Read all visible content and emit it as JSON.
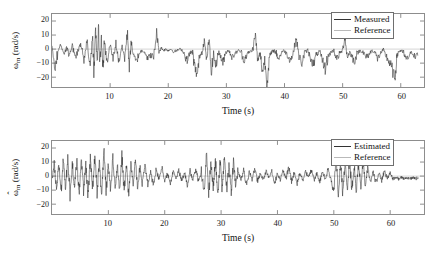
{
  "figure": {
    "background": "#ffffff",
    "panel_count": 2
  },
  "chart_data": [
    {
      "type": "line",
      "panel": "top",
      "title": "",
      "xlabel": "Time (s)",
      "ylabel": "ωm (rad/s)",
      "ylabel_symbol": "ω",
      "ylabel_subscript": "m",
      "ylabel_units": "(rad/s)",
      "xlim": [
        0,
        64
      ],
      "ylim": [
        -27,
        25
      ],
      "xticks": [
        10,
        20,
        30,
        40,
        50,
        60
      ],
      "yticks": [
        20,
        10,
        0,
        -10,
        -20
      ],
      "xtick_labels": [
        "10",
        "20",
        "30",
        "40",
        "50",
        "60"
      ],
      "ytick_labels": [
        "20",
        "10",
        "0",
        "−10",
        "−20"
      ],
      "grid": false,
      "legend_position": "top-right",
      "series": [
        {
          "name": "Measured",
          "color": "#2b2b2b",
          "description": "noisy motor speed with dense high-frequency oscillation 0-15 s and intermittent negative spikes to -25 rad/s afterwards",
          "x": [
            0.0,
            0.5,
            1.0,
            1.5,
            2.0,
            2.5,
            3.0,
            3.5,
            4.0,
            4.5,
            5.0,
            5.5,
            6.0,
            6.5,
            7.0,
            7.2,
            7.5,
            7.8,
            8.0,
            8.2,
            8.5,
            8.8,
            9.0,
            9.5,
            10.0,
            10.5,
            11.0,
            11.5,
            12.0,
            12.5,
            13.0,
            13.3,
            13.6,
            14.0,
            14.5,
            15.0,
            15.5,
            16.0,
            16.5,
            17.0,
            17.5,
            18.0,
            18.4,
            18.8,
            19.2,
            19.6,
            20.0,
            20.5,
            21.0,
            21.5,
            22.0,
            22.5,
            23.0,
            23.3,
            23.8,
            24.2,
            24.6,
            25.0,
            25.4,
            25.8,
            26.2,
            26.6,
            27.0,
            27.4,
            27.8,
            28.2,
            28.6,
            29.0,
            29.4,
            29.8,
            30.2,
            30.6,
            31.0,
            31.5,
            32.0,
            32.5,
            33.0,
            33.5,
            34.0,
            34.5,
            35.0,
            35.4,
            35.8,
            36.2,
            36.6,
            37.0,
            37.4,
            37.8,
            38.2,
            38.6,
            39.0,
            39.5,
            40.0,
            40.5,
            41.0,
            41.5,
            42.0,
            42.5,
            43.0,
            43.5,
            44.0,
            44.5,
            45.0,
            45.5,
            46.0,
            46.5,
            47.0,
            47.5,
            48.0,
            48.5,
            49.0,
            49.5,
            50.0,
            50.4,
            50.8,
            51.2,
            51.6,
            52.0,
            52.5,
            53.0,
            53.5,
            54.0,
            54.5,
            55.0,
            55.5,
            56.0,
            56.5,
            57.0,
            57.5,
            58.0,
            58.5,
            59.0,
            59.3,
            59.6,
            60.0,
            60.5,
            61.0,
            61.5,
            62.0,
            62.5,
            63.0,
            63.5
          ],
          "y": [
            -1,
            -13,
            -2,
            3,
            -4,
            1,
            -5,
            2,
            -6,
            -1,
            4,
            -8,
            6,
            -12,
            9,
            -16,
            14,
            -11,
            19,
            -13,
            7,
            -15,
            5,
            -10,
            3,
            -7,
            4,
            -9,
            2,
            -6,
            12,
            -14,
            6,
            -5,
            -9,
            -3,
            -1,
            -2,
            -7,
            -4,
            -6,
            12,
            -2,
            1,
            -1,
            0,
            -1,
            0,
            -2,
            -1,
            0,
            -1,
            -6,
            -8,
            -2,
            -3,
            -14,
            -18,
            -5,
            -2,
            6,
            -8,
            7,
            -16,
            -4,
            -12,
            -2,
            -5,
            -10,
            -3,
            -1,
            -2,
            -6,
            -3,
            -1,
            -2,
            -8,
            -4,
            -2,
            -1,
            10,
            -9,
            -3,
            -16,
            -8,
            -25,
            -6,
            -2,
            -1,
            -3,
            -7,
            -2,
            -1,
            -4,
            -8,
            -3,
            8,
            -5,
            -10,
            -2,
            -1,
            -6,
            -11,
            -4,
            -2,
            -8,
            -14,
            -5,
            -2,
            -1,
            -7,
            -3,
            -1,
            9,
            -6,
            -2,
            -5,
            -9,
            -3,
            -1,
            -2,
            -6,
            -4,
            -1,
            -2,
            -7,
            -3,
            -1,
            -5,
            -9,
            -14,
            -22,
            -6,
            -2,
            -1,
            -3,
            -8,
            -4,
            -2,
            -6,
            -3
          ]
        },
        {
          "name": "Reference",
          "color": "#c2c2c2",
          "description": "near-zero reference trace overlaid along the zero line",
          "x": [
            0,
            64
          ],
          "y": [
            0,
            0
          ]
        }
      ],
      "legend": [
        {
          "label": "Measured",
          "color": "#2b2b2b"
        },
        {
          "label": "Reference",
          "color": "#c2c2c2"
        }
      ]
    },
    {
      "type": "line",
      "panel": "bottom",
      "title": "",
      "xlabel": "Time (s)",
      "ylabel": "ω̂m (rad/s)",
      "ylabel_symbol": "ω",
      "ylabel_hat": "ˆ",
      "ylabel_subscript": "m",
      "ylabel_units": "(rad/s)",
      "xlim": [
        0,
        66
      ],
      "ylim": [
        -27,
        25
      ],
      "xticks": [
        10,
        20,
        30,
        40,
        50,
        60
      ],
      "yticks": [
        20,
        10,
        0,
        -10,
        -20
      ],
      "xtick_labels": [
        "10",
        "20",
        "30",
        "40",
        "50",
        "60"
      ],
      "ytick_labels": [
        "20",
        "10",
        "0",
        "−10",
        "−20"
      ],
      "grid": false,
      "legend_position": "top-right",
      "series": [
        {
          "name": "Estimated",
          "color": "#2b2b2b",
          "description": "estimated motor speed, dense symmetric oscillation +/-15 rad/s over 0-15 s, burst clusters near 28-32 s and 50-56 s, flat after 60 s",
          "x": [
            0.0,
            0.4,
            0.8,
            1.2,
            1.6,
            2.0,
            2.4,
            2.8,
            3.2,
            3.6,
            4.0,
            4.4,
            4.8,
            5.2,
            5.6,
            6.0,
            6.4,
            6.8,
            7.2,
            7.6,
            8.0,
            8.4,
            8.8,
            9.2,
            9.6,
            10.0,
            10.4,
            10.8,
            11.2,
            11.6,
            12.0,
            12.4,
            12.8,
            13.2,
            13.6,
            14.0,
            14.4,
            14.8,
            15.2,
            15.6,
            16.0,
            16.5,
            17.0,
            17.5,
            18.0,
            18.5,
            19.0,
            19.5,
            20.0,
            20.5,
            21.0,
            21.5,
            22.0,
            22.5,
            23.0,
            23.5,
            24.0,
            24.5,
            25.0,
            25.5,
            26.0,
            26.5,
            27.0,
            27.4,
            27.8,
            28.2,
            28.6,
            29.0,
            29.4,
            29.8,
            30.2,
            30.6,
            31.0,
            31.4,
            31.8,
            32.2,
            32.6,
            33.0,
            33.5,
            34.0,
            34.5,
            35.0,
            35.5,
            36.0,
            36.5,
            37.0,
            37.5,
            38.0,
            38.5,
            39.0,
            39.5,
            40.0,
            40.5,
            41.0,
            41.5,
            42.0,
            42.5,
            43.0,
            43.5,
            44.0,
            44.5,
            45.0,
            45.5,
            46.0,
            46.5,
            47.0,
            47.5,
            48.0,
            48.5,
            49.0,
            49.5,
            50.0,
            50.4,
            50.8,
            51.2,
            51.6,
            52.0,
            52.4,
            52.8,
            53.2,
            53.6,
            54.0,
            54.4,
            54.8,
            55.2,
            55.6,
            56.0,
            56.5,
            57.0,
            57.5,
            58.0,
            58.5,
            59.0,
            59.5,
            60.0,
            60.5,
            61.0,
            61.5,
            62.0,
            62.5,
            63.0,
            63.5,
            64.0,
            64.5,
            65.0
          ],
          "y": [
            -2,
            10,
            -11,
            9,
            -12,
            11,
            -10,
            13,
            -14,
            10,
            -9,
            12,
            -13,
            15,
            -11,
            9,
            -14,
            12,
            -10,
            16,
            -13,
            11,
            -15,
            20,
            -12,
            9,
            -11,
            13,
            -10,
            8,
            -12,
            15,
            -11,
            9,
            -13,
            10,
            -8,
            11,
            -9,
            7,
            -5,
            8,
            -6,
            4,
            -7,
            5,
            -3,
            6,
            -4,
            2,
            -5,
            3,
            -2,
            4,
            -3,
            2,
            -6,
            4,
            -3,
            5,
            -4,
            3,
            -12,
            18,
            -14,
            11,
            -9,
            13,
            -16,
            12,
            -10,
            15,
            -11,
            9,
            -13,
            10,
            -8,
            5,
            -3,
            4,
            -6,
            3,
            -2,
            5,
            -4,
            2,
            -3,
            4,
            -2,
            3,
            -5,
            2,
            -3,
            4,
            -2,
            6,
            -4,
            3,
            -5,
            2,
            -3,
            4,
            -2,
            5,
            -3,
            2,
            -4,
            3,
            -2,
            5,
            -3,
            -11,
            14,
            -12,
            10,
            -13,
            11,
            -9,
            12,
            -10,
            8,
            -11,
            9,
            -7,
            10,
            -8,
            6,
            -4,
            3,
            -5,
            2,
            -3,
            4,
            -2,
            3,
            -2,
            -1,
            -2,
            -1,
            -2,
            -1,
            -2,
            -1,
            -2,
            -1
          ]
        },
        {
          "name": "Reference",
          "color": "#c2c2c2",
          "description": "near-zero reference trace overlaid along the zero line",
          "x": [
            0,
            66
          ],
          "y": [
            0,
            0
          ]
        }
      ],
      "legend": [
        {
          "label": "Estimated",
          "color": "#2b2b2b"
        },
        {
          "label": "Reference",
          "color": "#c2c2c2"
        }
      ]
    }
  ]
}
